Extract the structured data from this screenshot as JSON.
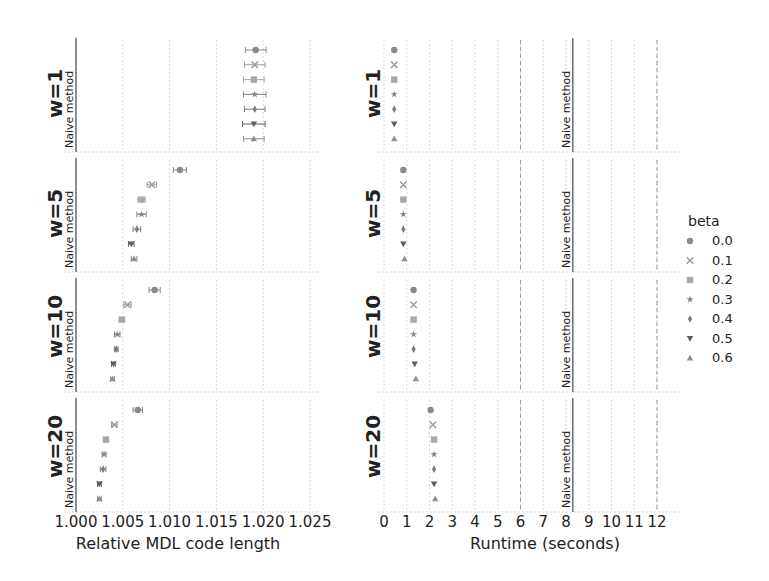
{
  "chart_data": [
    {
      "type": "scatter",
      "title": "",
      "xlabel": "Relative MDL code length",
      "ylabel": "",
      "xlim": [
        1.0,
        1.0275
      ],
      "xticks": [
        "1.000",
        "1.005",
        "1.010",
        "1.015",
        "1.020",
        "1.025"
      ],
      "grid": true,
      "facets": [
        "w=1",
        "w=5",
        "w=10",
        "w=20"
      ],
      "reference_line": {
        "label": "Naive method",
        "x": 1.0
      },
      "series": [
        {
          "name": "0.0",
          "marker": "circle",
          "values": [
            1.0192,
            1.0111,
            1.0084,
            1.0066
          ],
          "err": [
            0.0011,
            0.0007,
            0.0006,
            0.0005
          ]
        },
        {
          "name": "0.1",
          "marker": "x",
          "values": [
            1.0191,
            1.0081,
            1.0055,
            1.0041
          ],
          "err": [
            0.0011,
            0.0005,
            0.0004,
            0.0003
          ]
        },
        {
          "name": "0.2",
          "marker": "square",
          "values": [
            1.019,
            1.007,
            1.0049,
            1.0032
          ],
          "err": [
            0.0011,
            0.0004,
            0.0003,
            0.0002
          ]
        },
        {
          "name": "0.3",
          "marker": "star",
          "values": [
            1.0191,
            1.007,
            1.0044,
            1.003
          ],
          "err": [
            0.0012,
            0.0005,
            0.0003,
            0.0002
          ]
        },
        {
          "name": "0.4",
          "marker": "thin_diamond",
          "values": [
            1.0191,
            1.0065,
            1.0043,
            1.0029
          ],
          "err": [
            0.0011,
            0.0004,
            0.0002,
            0.0003
          ]
        },
        {
          "name": "0.5",
          "marker": "triangle_down",
          "values": [
            1.019,
            1.0059,
            1.004,
            1.0025
          ],
          "err": [
            0.0012,
            0.0003,
            0.0002,
            0.0002
          ]
        },
        {
          "name": "0.6",
          "marker": "triangle_up",
          "values": [
            1.019,
            1.0062,
            1.0039,
            1.0025
          ],
          "err": [
            0.0011,
            0.0003,
            0.0002,
            0.0002
          ]
        }
      ]
    },
    {
      "type": "scatter",
      "title": "",
      "xlabel": "Runtime (seconds)",
      "ylabel": "",
      "xlim": [
        -0.2,
        12.5
      ],
      "xticks": [
        "0",
        "1",
        "2",
        "3",
        "4",
        "5",
        "6",
        "7",
        "8",
        "9",
        "10",
        "11",
        "12"
      ],
      "grid": true,
      "facets": [
        "w=1",
        "w=5",
        "w=10",
        "w=20"
      ],
      "reference_line": {
        "label": "Naive method",
        "x": 8.3
      },
      "dashed_lines": [
        6,
        12
      ],
      "series": [
        {
          "name": "0.0",
          "marker": "circle",
          "values": [
            0.45,
            0.85,
            1.3,
            2.05
          ]
        },
        {
          "name": "0.1",
          "marker": "x",
          "values": [
            0.45,
            0.85,
            1.3,
            2.15
          ]
        },
        {
          "name": "0.2",
          "marker": "square",
          "values": [
            0.45,
            0.85,
            1.3,
            2.2
          ]
        },
        {
          "name": "0.3",
          "marker": "star",
          "values": [
            0.45,
            0.85,
            1.3,
            2.2
          ]
        },
        {
          "name": "0.4",
          "marker": "thin_diamond",
          "values": [
            0.45,
            0.85,
            1.3,
            2.2
          ]
        },
        {
          "name": "0.5",
          "marker": "triangle_down",
          "values": [
            0.45,
            0.85,
            1.35,
            2.2
          ]
        },
        {
          "name": "0.6",
          "marker": "triangle_up",
          "values": [
            0.45,
            0.9,
            1.4,
            2.25
          ]
        }
      ]
    }
  ],
  "legend": {
    "title": "beta",
    "position": "right",
    "entries": [
      {
        "label": "0.0",
        "marker": "circle"
      },
      {
        "label": "0.1",
        "marker": "x"
      },
      {
        "label": "0.2",
        "marker": "square"
      },
      {
        "label": "0.3",
        "marker": "star"
      },
      {
        "label": "0.4",
        "marker": "thin_diamond"
      },
      {
        "label": "0.5",
        "marker": "triangle_down"
      },
      {
        "label": "0.6",
        "marker": "triangle_up"
      }
    ]
  },
  "colors": {
    "markers": [
      "#8a8a8a",
      "#9a9a9a",
      "#a8a8a8",
      "#858585",
      "#7a7a7a",
      "#5e5e5e",
      "#8f8f8f"
    ],
    "grid": "#d9d9d9",
    "naive_line": "#555555",
    "dashed_line": "#9a9a9a",
    "text": "#222222"
  }
}
